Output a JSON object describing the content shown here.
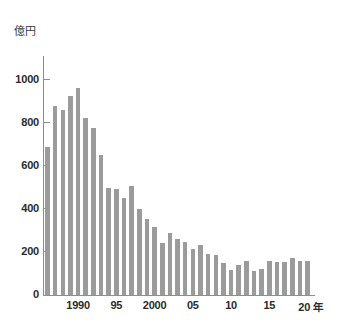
{
  "chart_data": {
    "type": "bar",
    "title": "",
    "subtitle": "",
    "xlabel": "年",
    "ylabel": "億円",
    "unit_label": "億円",
    "year_suffix": "年",
    "ylim": [
      0,
      1100
    ],
    "y_ticks": [
      0,
      200,
      400,
      600,
      800,
      1000
    ],
    "y_tick_labels": [
      "0",
      "200",
      "400",
      "600",
      "800",
      "1000"
    ],
    "grid": false,
    "legend": null,
    "bar_color": "#9b9b9b",
    "axis_color": "#8e8e8e",
    "text_color": "#2b2b2b",
    "x_tick_years": [
      1990,
      1995,
      2000,
      2005,
      2010,
      2015,
      2020
    ],
    "x_tick_labels": [
      "1990",
      "95",
      "2000",
      "05",
      "10",
      "15",
      "20"
    ],
    "categories": [
      "1986",
      "1987",
      "1988",
      "1989",
      "1990",
      "1991",
      "1992",
      "1993",
      "1994",
      "1995",
      "1996",
      "1997",
      "1998",
      "1999",
      "2000",
      "2001",
      "2002",
      "2003",
      "2004",
      "2005",
      "2006",
      "2007",
      "2008",
      "2009",
      "2010",
      "2011",
      "2012",
      "2013",
      "2014",
      "2015",
      "2016",
      "2017",
      "2018",
      "2019",
      "2020"
    ],
    "values": [
      685,
      875,
      858,
      922,
      960,
      820,
      775,
      650,
      495,
      490,
      448,
      508,
      397,
      355,
      318,
      240,
      288,
      260,
      248,
      215,
      234,
      192,
      187,
      148,
      118,
      141,
      157,
      113,
      119,
      160,
      154,
      151,
      171,
      160,
      160
    ]
  }
}
